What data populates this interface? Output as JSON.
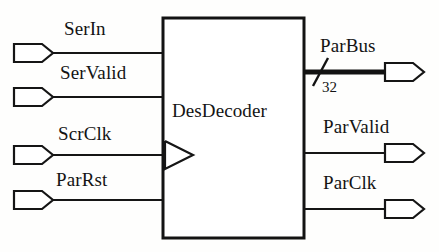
{
  "diagram": {
    "type": "block-diagram",
    "title": "DesDecoder",
    "background_color": "#fefefd",
    "line_color": "#151515",
    "block": {
      "label": "DesDecoder",
      "x": 163,
      "y": 18,
      "width": 141,
      "height": 220,
      "label_x": 172,
      "label_y": 101,
      "clock_marker": "triangle"
    },
    "inputs": [
      {
        "name": "SerIn",
        "label": "SerIn",
        "label_x": 64,
        "label_y": 19,
        "wire_y": 53,
        "pin_x": 14,
        "clocked": false
      },
      {
        "name": "SerValid",
        "label": "SerValid",
        "label_x": 60,
        "label_y": 63,
        "wire_y": 97,
        "pin_x": 14,
        "clocked": false
      },
      {
        "name": "ScrClk",
        "label": "ScrClk",
        "label_x": 58,
        "label_y": 124,
        "wire_y": 155,
        "pin_x": 14,
        "clocked": true
      },
      {
        "name": "ParRst",
        "label": "ParRst",
        "label_x": 56,
        "label_y": 170,
        "wire_y": 200,
        "pin_x": 14,
        "clocked": false
      }
    ],
    "outputs": [
      {
        "name": "ParBus",
        "label": "ParBus",
        "label_x": 320,
        "label_y": 36,
        "wire_y": 72,
        "pin_x": 385,
        "is_bus": true,
        "bus_width": "32",
        "width_label_x": 322,
        "width_label_y": 80,
        "slash_x": 320
      },
      {
        "name": "ParValid",
        "label": "ParValid",
        "label_x": 323,
        "label_y": 117,
        "wire_y": 153,
        "pin_x": 385,
        "is_bus": false,
        "bus_width": "",
        "width_label_x": 0,
        "width_label_y": 0,
        "slash_x": 0
      },
      {
        "name": "ParClk",
        "label": "ParClk",
        "label_x": 323,
        "label_y": 173,
        "wire_y": 209,
        "pin_x": 385,
        "is_bus": false,
        "bus_width": "",
        "width_label_x": 0,
        "width_label_y": 0,
        "slash_x": 0
      }
    ]
  }
}
